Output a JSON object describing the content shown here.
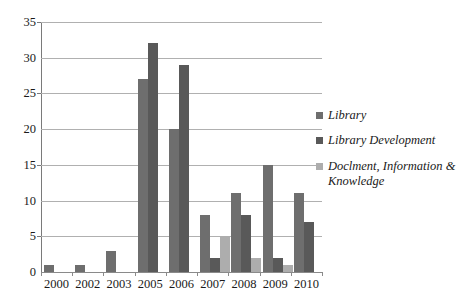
{
  "chart_data": {
    "type": "bar",
    "title": "",
    "subtitle": "",
    "xlabel": "",
    "ylabel": "",
    "ylim": [
      0,
      35
    ],
    "ytick_step": 5,
    "yticks": [
      "0",
      "5",
      "10",
      "15",
      "20",
      "25",
      "30",
      "35"
    ],
    "grid": true,
    "legend_position": "right",
    "categories": [
      "2000",
      "2002",
      "2003",
      "2005",
      "2006",
      "2007",
      "2008",
      "2009",
      "2010"
    ],
    "series": [
      {
        "name": "Library",
        "color": "#6e6e6e",
        "values": [
          1,
          1,
          3,
          27,
          20,
          8,
          11,
          15,
          11
        ]
      },
      {
        "name": "Library Development",
        "color": "#595959",
        "values": [
          null,
          null,
          null,
          32,
          29,
          2,
          8,
          2,
          7
        ]
      },
      {
        "name": "Doclment, Information & Knowledge",
        "color": "#adadad",
        "values": [
          null,
          null,
          null,
          null,
          null,
          5,
          2,
          1,
          null
        ]
      }
    ]
  }
}
